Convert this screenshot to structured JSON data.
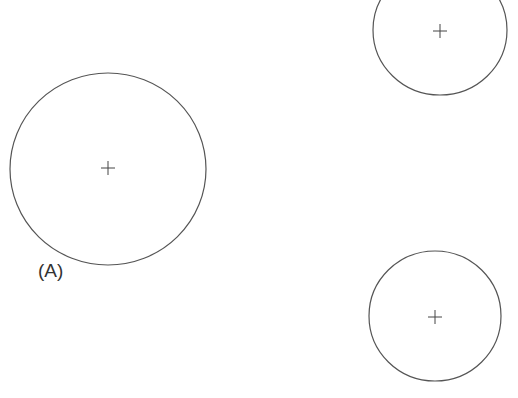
{
  "diagram": {
    "stroke_color": "#555555",
    "background": "#ffffff",
    "circles": [
      {
        "id": "large-circle",
        "cx": 108,
        "cy": 169,
        "rx": 98,
        "ry": 96,
        "has_center_mark": true
      },
      {
        "id": "top-right-circle",
        "cx": 440,
        "cy": 30,
        "rx": 67,
        "ry": 65,
        "has_center_mark": true
      },
      {
        "id": "bottom-right-circle",
        "cx": 435,
        "cy": 316,
        "rx": 66,
        "ry": 65,
        "has_center_mark": true
      }
    ],
    "labels": [
      {
        "id": "label-a",
        "text": "(A)"
      }
    ]
  }
}
